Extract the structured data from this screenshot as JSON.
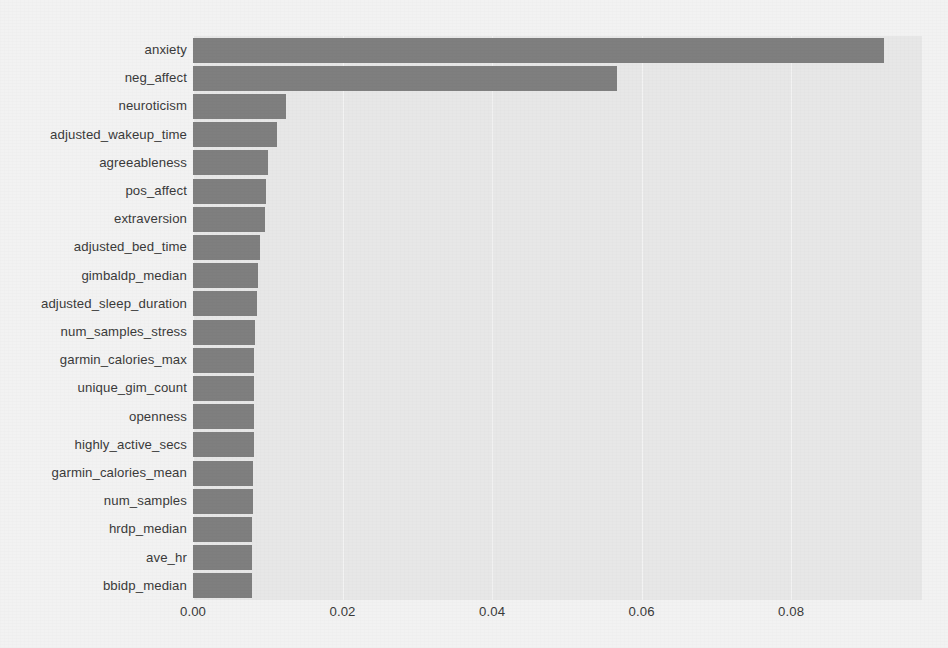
{
  "chart_data": {
    "type": "bar",
    "orientation": "horizontal",
    "title": "",
    "subtitle": "",
    "xlabel": "",
    "ylabel": "",
    "xlim": [
      0.0,
      0.0975
    ],
    "xticks": [
      0.0,
      0.02,
      0.04,
      0.06,
      0.08
    ],
    "xtick_labels": [
      "0.00",
      "0.02",
      "0.04",
      "0.06",
      "0.08"
    ],
    "grid": true,
    "legend": false,
    "bar_color": "#7f7f7f",
    "plot_background": "#e7e7e7",
    "figure_background": "#f2f2f2",
    "categories": [
      "anxiety",
      "neg_affect",
      "neuroticism",
      "adjusted_wakeup_time",
      "agreeableness",
      "pos_affect",
      "extraversion",
      "adjusted_bed_time",
      "gimbaldp_median",
      "adjusted_sleep_duration",
      "num_samples_stress",
      "garmin_calories_max",
      "unique_gim_count",
      "openness",
      "highly_active_secs",
      "garmin_calories_mean",
      "num_samples",
      "hrdp_median",
      "ave_hr",
      "bbidp_median"
    ],
    "values": [
      0.0924,
      0.0567,
      0.0124,
      0.0112,
      0.01,
      0.0098,
      0.0096,
      0.009,
      0.0087,
      0.0086,
      0.0083,
      0.0082,
      0.0082,
      0.0081,
      0.0081,
      0.008,
      0.008,
      0.0079,
      0.0079,
      0.0079
    ]
  }
}
